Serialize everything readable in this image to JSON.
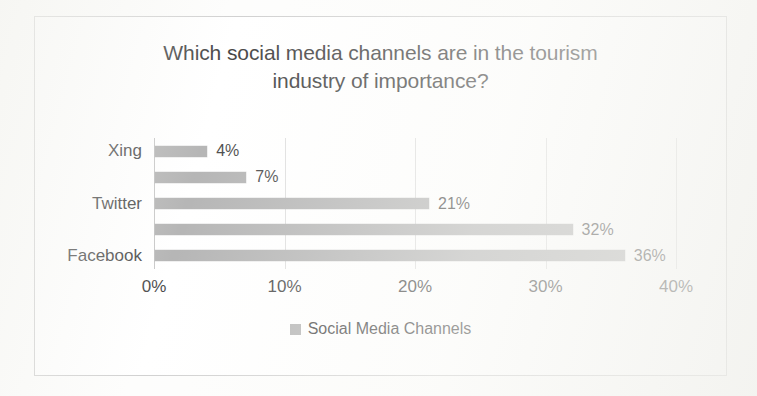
{
  "chart_data": {
    "type": "bar",
    "orientation": "horizontal",
    "title": "Which social media channels are in the tourism industry of importance?",
    "title_lines": [
      "Which social media channels are in the tourism",
      "industry of importance?"
    ],
    "categories": [
      "Xing",
      "",
      "Twitter",
      "",
      "Facebook"
    ],
    "visible_category_labels": [
      "Xing",
      "Twitter",
      "Facebook"
    ],
    "values": [
      4,
      7,
      21,
      32,
      36
    ],
    "data_labels": [
      "4%",
      "7%",
      "21%",
      "32%",
      "36%"
    ],
    "series": [
      {
        "name": "Social Media Channels",
        "values": [
          4,
          7,
          21,
          32,
          36
        ]
      }
    ],
    "xlabel": "",
    "ylabel": "",
    "xlim": [
      0,
      40
    ],
    "xticks": [
      0,
      10,
      20,
      30,
      40
    ],
    "xtick_labels": [
      "0%",
      "10%",
      "20%",
      "30%",
      "40%"
    ],
    "grid": true,
    "grid_axis": "x",
    "legend": {
      "position": "bottom",
      "entries": [
        {
          "label": "Social Media Channels",
          "color": "#a9a9a9"
        }
      ]
    },
    "colors": {
      "bar": "#a9a9a9",
      "gridline": "#d9d9d9",
      "axis": "#bfbfbf",
      "text": "#2b2b2b",
      "frame": "#c9c9c9",
      "plot_background": "#ffffff"
    }
  }
}
